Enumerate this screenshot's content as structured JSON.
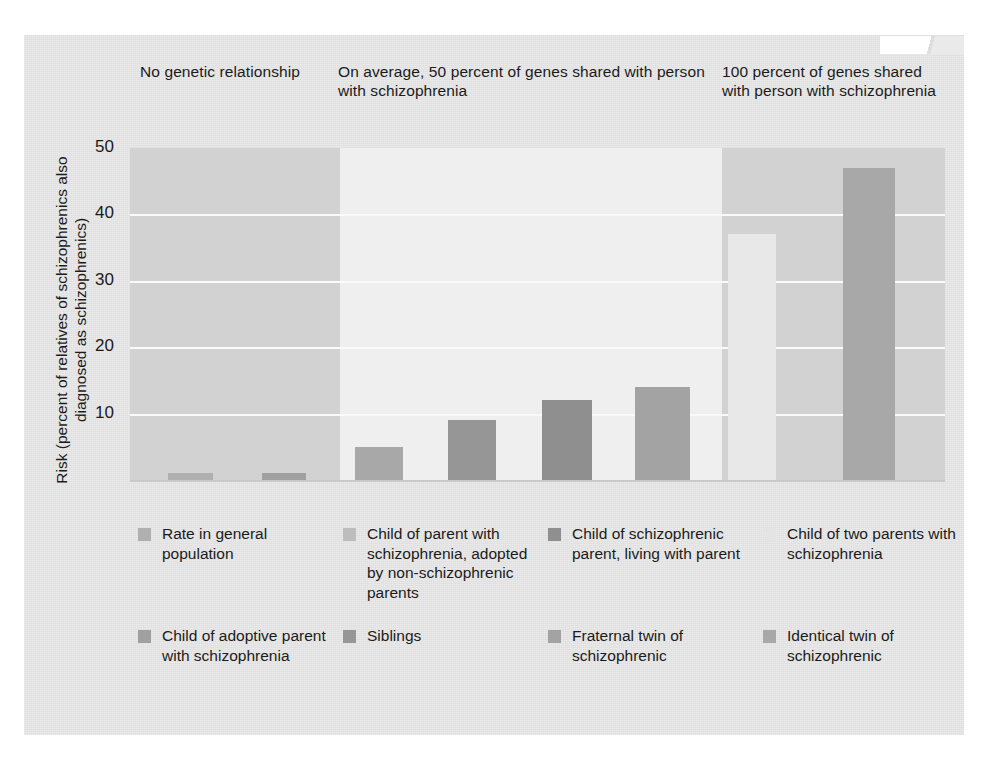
{
  "figure": {
    "panel_headers": [
      "No genetic relationship",
      "On average, 50 percent of genes shared with person with schizophrenia",
      "100 percent of genes shared with person with schizophrenia"
    ]
  },
  "chart_data": {
    "type": "bar",
    "title": "",
    "ylabel": "Risk (percent of relatives of schizophrenics also diagnosed as schizophrenics)",
    "xlabel": "",
    "ylim": [
      0,
      50
    ],
    "yticks": [
      "10",
      "20",
      "30",
      "40",
      "50"
    ],
    "ytick_values": [
      10,
      20,
      30,
      40,
      50
    ],
    "grid": true,
    "legend_position": "below",
    "groups": [
      {
        "header": "No genetic relationship",
        "shade": "#d2d2d2",
        "bars": [
          {
            "label": "Rate in general population",
            "value": 1,
            "color": "#b0b0b0"
          },
          {
            "label": "Child of adoptive parent with schizophrenia",
            "value": 1,
            "color": "#a0a0a0"
          }
        ]
      },
      {
        "header": "On average, 50 percent of genes shared with person with schizophrenia",
        "shade": "#efefef",
        "bars": [
          {
            "label": "Child of parent with schizophrenia, adopted by non-schizophrenic parents",
            "value": 5,
            "color": "#a8a8a8"
          },
          {
            "label": "Siblings",
            "value": 9,
            "color": "#969696"
          },
          {
            "label": "Child of schizophrenic parent, living with parent",
            "value": 12,
            "color": "#8f8f8f"
          },
          {
            "label": "Fraternal twin of schizophrenic",
            "value": 14,
            "color": "#a3a3a3"
          }
        ]
      },
      {
        "header": "100 percent of genes shared with person with schizophrenia",
        "shade": "#d2d2d2",
        "bars": [
          {
            "label": "Child of two parents with schizophrenia",
            "value": 37,
            "color": "#e8e8e8"
          },
          {
            "label": "Identical twin of schizophrenic",
            "value": 47,
            "color": "#a8a8a8"
          }
        ]
      }
    ],
    "legend": [
      {
        "label": "Rate in general population",
        "color": "#b0b0b0"
      },
      {
        "label": "Child of parent with schizophrenia, adopted by non-schizophrenic parents",
        "color": "#bdbdbd"
      },
      {
        "label": "Child of schizophrenic parent, living with parent",
        "color": "#8f8f8f"
      },
      {
        "label": "Child of two parents with schizophrenia",
        "color": "#e4e4e4"
      },
      {
        "label": "Child of adoptive parent with schizophrenia",
        "color": "#a0a0a0"
      },
      {
        "label": "Siblings",
        "color": "#969696"
      },
      {
        "label": "Fraternal twin of schizophrenic",
        "color": "#a3a3a3"
      },
      {
        "label": "Identical twin of schizophrenic",
        "color": "#a8a8a8"
      }
    ]
  }
}
